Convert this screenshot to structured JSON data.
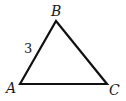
{
  "diagram": {
    "type": "triangle",
    "vertices": {
      "A": {
        "label": "A",
        "x": 20,
        "y": 84
      },
      "B": {
        "label": "B",
        "x": 56,
        "y": 21
      },
      "C": {
        "label": "C",
        "x": 107,
        "y": 84
      }
    },
    "side_labels": {
      "AB": "3"
    },
    "stroke_color": "#111111"
  }
}
